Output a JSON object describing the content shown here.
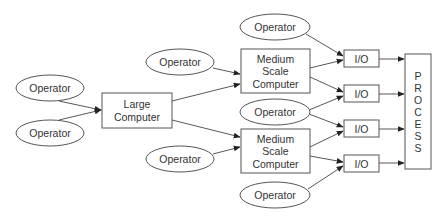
{
  "diagram": {
    "title": "",
    "colors": {
      "stroke": "#555555",
      "edge": "#444444",
      "text": "#333333",
      "fill": "#ffffff"
    },
    "nodes": [
      {
        "id": "op_left_top",
        "type": "ellipse",
        "label": [
          "Operator"
        ],
        "cx": 50,
        "cy": 88,
        "rx": 34,
        "ry": 13
      },
      {
        "id": "op_left_bottom",
        "type": "ellipse",
        "label": [
          "Operator"
        ],
        "cx": 50,
        "cy": 133,
        "rx": 34,
        "ry": 13
      },
      {
        "id": "large_computer",
        "type": "rect",
        "label": [
          "Large",
          "Computer"
        ],
        "x": 102,
        "y": 93,
        "w": 70,
        "h": 35
      },
      {
        "id": "op_mid_top",
        "type": "ellipse",
        "label": [
          "Operator"
        ],
        "cx": 180,
        "cy": 62,
        "rx": 34,
        "ry": 13
      },
      {
        "id": "op_mid_bottom",
        "type": "ellipse",
        "label": [
          "Operator"
        ],
        "cx": 180,
        "cy": 159,
        "rx": 34,
        "ry": 13
      },
      {
        "id": "medium_computer_1",
        "type": "rect",
        "label": [
          "Medium",
          "Scale",
          "Computer"
        ],
        "x": 241,
        "y": 49,
        "w": 69,
        "h": 44
      },
      {
        "id": "medium_computer_2",
        "type": "rect",
        "label": [
          "Medium",
          "Scale",
          "Computer"
        ],
        "x": 241,
        "y": 129,
        "w": 69,
        "h": 44
      },
      {
        "id": "op_right_top",
        "type": "ellipse",
        "label": [
          "Operator"
        ],
        "cx": 275,
        "cy": 27,
        "rx": 35,
        "ry": 13
      },
      {
        "id": "op_right_middle",
        "type": "ellipse",
        "label": [
          "Operator"
        ],
        "cx": 275,
        "cy": 112,
        "rx": 35,
        "ry": 13
      },
      {
        "id": "op_right_bottom",
        "type": "ellipse",
        "label": [
          "Operator"
        ],
        "cx": 275,
        "cy": 195,
        "rx": 35,
        "ry": 13
      },
      {
        "id": "io_1",
        "type": "rect",
        "label": [
          "I/O"
        ],
        "x": 344,
        "y": 50,
        "w": 35,
        "h": 17
      },
      {
        "id": "io_2",
        "type": "rect",
        "label": [
          "I/O"
        ],
        "x": 344,
        "y": 85,
        "w": 35,
        "h": 17
      },
      {
        "id": "io_3",
        "type": "rect",
        "label": [
          "I/O"
        ],
        "x": 344,
        "y": 120,
        "w": 35,
        "h": 17
      },
      {
        "id": "io_4",
        "type": "rect",
        "label": [
          "I/O"
        ],
        "x": 344,
        "y": 155,
        "w": 35,
        "h": 17
      },
      {
        "id": "process",
        "type": "rect-vertical",
        "label": [
          "P",
          "R",
          "O",
          "C",
          "E",
          "S",
          "S"
        ],
        "x": 405,
        "y": 54,
        "w": 26,
        "h": 115
      }
    ],
    "edges": [
      {
        "from": "op_left_top",
        "to": "large_computer",
        "x1": 59,
        "y1": 101,
        "x2": 101,
        "y2": 110
      },
      {
        "from": "op_left_bottom",
        "to": "large_computer",
        "x1": 59,
        "y1": 120,
        "x2": 101,
        "y2": 110
      },
      {
        "from": "op_mid_top",
        "to": "medium_computer_1",
        "x1": 213,
        "y1": 68,
        "x2": 240,
        "y2": 74
      },
      {
        "from": "large_computer",
        "to": "medium_computer_1",
        "x1": 172,
        "y1": 101,
        "x2": 240,
        "y2": 84
      },
      {
        "from": "large_computer",
        "to": "medium_computer_2",
        "x1": 172,
        "y1": 120,
        "x2": 240,
        "y2": 137
      },
      {
        "from": "op_mid_bottom",
        "to": "medium_computer_2",
        "x1": 213,
        "y1": 154,
        "x2": 240,
        "y2": 147
      },
      {
        "from": "op_right_top",
        "to": "io_1",
        "x1": 306,
        "y1": 34,
        "x2": 343,
        "y2": 56
      },
      {
        "from": "medium_computer_1",
        "to": "io_1",
        "x1": 310,
        "y1": 68,
        "x2": 343,
        "y2": 60
      },
      {
        "from": "medium_computer_1",
        "to": "io_2",
        "x1": 310,
        "y1": 77,
        "x2": 343,
        "y2": 92
      },
      {
        "from": "op_right_middle",
        "to": "io_2",
        "x1": 309,
        "y1": 110,
        "x2": 343,
        "y2": 96
      },
      {
        "from": "op_right_middle",
        "to": "io_3",
        "x1": 309,
        "y1": 114,
        "x2": 343,
        "y2": 127
      },
      {
        "from": "medium_computer_2",
        "to": "io_3",
        "x1": 310,
        "y1": 147,
        "x2": 343,
        "y2": 131
      },
      {
        "from": "medium_computer_2",
        "to": "io_4",
        "x1": 310,
        "y1": 156,
        "x2": 343,
        "y2": 162
      },
      {
        "from": "op_right_bottom",
        "to": "io_4",
        "x1": 308,
        "y1": 189,
        "x2": 343,
        "y2": 166
      },
      {
        "from": "io_1",
        "to": "process",
        "x1": 379,
        "y1": 59,
        "x2": 404,
        "y2": 59
      },
      {
        "from": "io_2",
        "to": "process",
        "x1": 379,
        "y1": 94,
        "x2": 404,
        "y2": 94
      },
      {
        "from": "io_3",
        "to": "process",
        "x1": 379,
        "y1": 129,
        "x2": 404,
        "y2": 129
      },
      {
        "from": "io_4",
        "to": "process",
        "x1": 379,
        "y1": 163,
        "x2": 404,
        "y2": 163
      }
    ]
  }
}
